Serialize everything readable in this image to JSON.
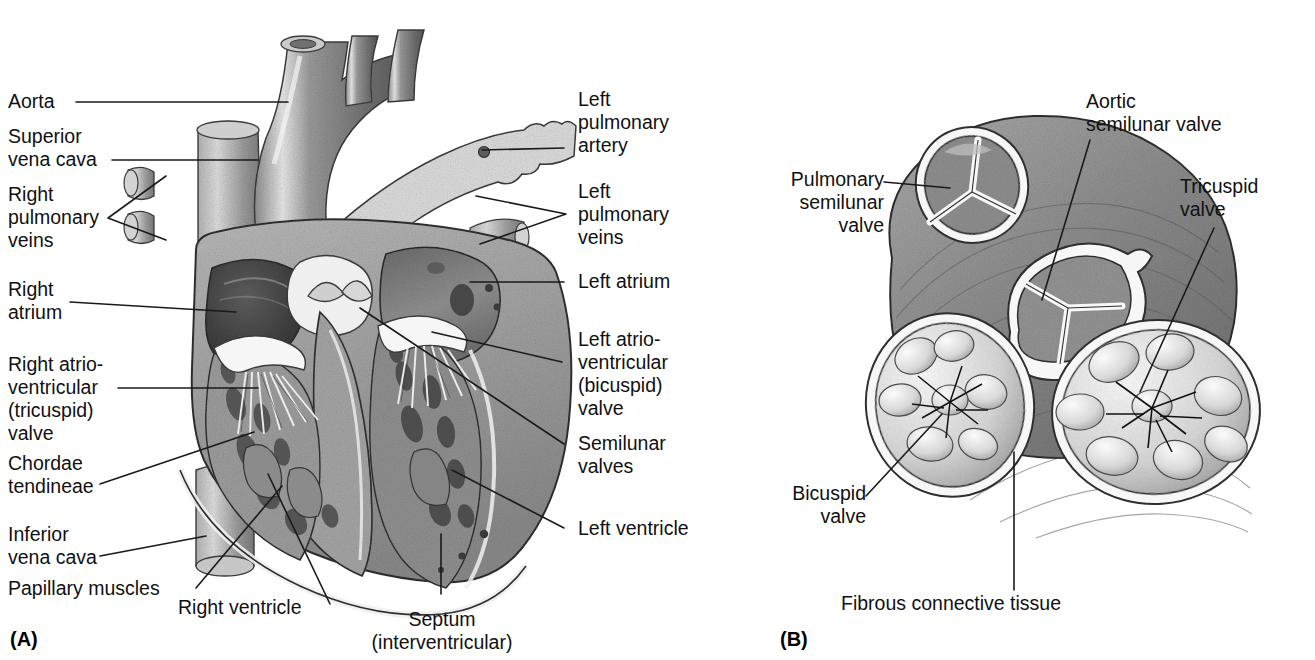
{
  "figure": {
    "panels": [
      {
        "id": "A",
        "caption": "(A)",
        "description": "Frontal (coronal) section of the heart showing chambers, valves and great vessels"
      },
      {
        "id": "B",
        "caption": "(B)",
        "description": "Superior view of the heart valves in the fibrous skeleton with the atria removed"
      }
    ]
  },
  "panelA": {
    "caption": "(A)",
    "labels_left": [
      {
        "key": "aorta",
        "text": "Aorta"
      },
      {
        "key": "superior-vena-cava",
        "text": "Superior\nvena cava"
      },
      {
        "key": "right-pulmonary-veins",
        "text": "Right\npulmonary\nveins"
      },
      {
        "key": "right-atrium",
        "text": "Right\natrium"
      },
      {
        "key": "right-av-tricuspid-valve",
        "text": "Right atrio-\nventricular\n(tricuspid)\nvalve"
      },
      {
        "key": "chordae-tendineae",
        "text": "Chordae\ntendineae"
      },
      {
        "key": "inferior-vena-cava",
        "text": "Inferior\nvena cava"
      },
      {
        "key": "papillary-muscles",
        "text": "Papillary muscles"
      }
    ],
    "labels_right": [
      {
        "key": "left-pulmonary-artery",
        "text": "Left\npulmonary\nartery"
      },
      {
        "key": "left-pulmonary-veins",
        "text": "Left\npulmonary\nveins"
      },
      {
        "key": "left-atrium",
        "text": "Left atrium"
      },
      {
        "key": "left-av-bicuspid-valve",
        "text": "Left atrio-\nventricular\n(bicuspid)\nvalve"
      },
      {
        "key": "semilunar-valves",
        "text": "Semilunar\nvalves"
      },
      {
        "key": "left-ventricle",
        "text": "Left ventricle"
      }
    ],
    "labels_bottom": [
      {
        "key": "right-ventricle",
        "text": "Right ventricle"
      },
      {
        "key": "septum-interventricular",
        "text": "Septum\n(interventricular)"
      }
    ]
  },
  "panelB": {
    "caption": "(B)",
    "labels": [
      {
        "key": "pulmonary-semilunar-valve",
        "text": "Pulmonary\nsemilunar\nvalve"
      },
      {
        "key": "aortic-semilunar-valve",
        "text": "Aortic\nsemilunar valve"
      },
      {
        "key": "tricuspid-valve",
        "text": "Tricuspid\nvalve"
      },
      {
        "key": "bicuspid-valve",
        "text": "Bicuspid\nvalve"
      },
      {
        "key": "fibrous-connective-tissue",
        "text": "Fibrous connective tissue"
      }
    ]
  },
  "colors": {
    "ink": "#111111",
    "leader": "#1a1a1a",
    "background": "#ffffff",
    "tissue_dark": "#6f6f6f",
    "tissue_mid": "#9a9a9a",
    "tissue_light": "#c9c9c9",
    "cavity_dark": "#4a4a4a",
    "endocardium": "#f4f4f4"
  }
}
